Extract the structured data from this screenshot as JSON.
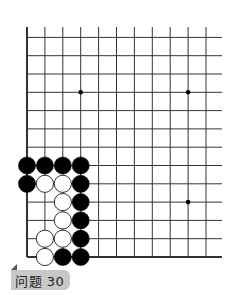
{
  "puzzle": {
    "label": "问题 30",
    "colors": {
      "background": "#ffffff",
      "grid_line": "#333333",
      "black_stone": "#000000",
      "white_stone": "#ffffff",
      "label_bg": "#c8c8c8"
    },
    "grid": {
      "columns": 11,
      "rows": 13,
      "origin_x": 27,
      "bottom_y": 257,
      "col_spacing": 17.9,
      "row_spacing": 18.3,
      "left_edge": true,
      "bottom_edge": true,
      "right_extend_to": 222,
      "top_extend_to": 27
    },
    "star_points": [
      {
        "col": 3,
        "row": 9
      },
      {
        "col": 9,
        "row": 9
      },
      {
        "col": 9,
        "row": 3
      }
    ],
    "stones": [
      {
        "col": 0,
        "row": 5,
        "color": "black"
      },
      {
        "col": 1,
        "row": 5,
        "color": "black"
      },
      {
        "col": 2,
        "row": 5,
        "color": "black"
      },
      {
        "col": 3,
        "row": 5,
        "color": "black"
      },
      {
        "col": 0,
        "row": 4,
        "color": "black"
      },
      {
        "col": 1,
        "row": 4,
        "color": "white"
      },
      {
        "col": 2,
        "row": 4,
        "color": "white"
      },
      {
        "col": 3,
        "row": 4,
        "color": "black"
      },
      {
        "col": 2,
        "row": 3,
        "color": "white"
      },
      {
        "col": 3,
        "row": 3,
        "color": "black"
      },
      {
        "col": 2,
        "row": 2,
        "color": "white"
      },
      {
        "col": 3,
        "row": 2,
        "color": "black"
      },
      {
        "col": 1,
        "row": 1,
        "color": "white"
      },
      {
        "col": 2,
        "row": 1,
        "color": "white"
      },
      {
        "col": 3,
        "row": 1,
        "color": "black"
      },
      {
        "col": 1,
        "row": 0,
        "color": "white"
      },
      {
        "col": 2,
        "row": 0,
        "color": "black"
      },
      {
        "col": 3,
        "row": 0,
        "color": "black"
      }
    ]
  }
}
